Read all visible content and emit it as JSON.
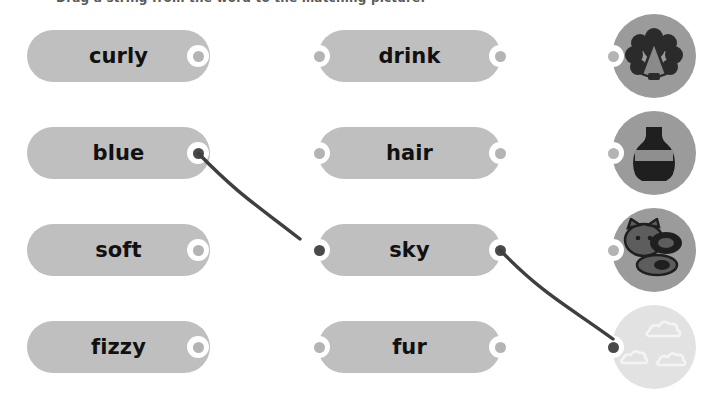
{
  "instruction": "Drag a string from the word to the matching picture.",
  "colors": {
    "pill": "#bfbfbf",
    "pill_text": "#111111",
    "knob_ring": "#ffffff",
    "knob_dot": "#b4b4b4",
    "knob_dot_active": "#4a4a4a",
    "picture_circle": "#9b9b9b",
    "picture_circle_faded": "#e2e2e2",
    "wire": "#3f3f3f",
    "background": "#ffffff"
  },
  "columns": {
    "left": {
      "name": "adjectives",
      "items": [
        {
          "label": "curly",
          "x": 27,
          "y": 30,
          "w": 183,
          "h": 52,
          "knob_x": 187,
          "knob_y": 45,
          "connected": false
        },
        {
          "label": "blue",
          "x": 27,
          "y": 127,
          "w": 183,
          "h": 52,
          "knob_x": 187,
          "knob_y": 142,
          "connected": true
        },
        {
          "label": "soft",
          "x": 27,
          "y": 224,
          "w": 183,
          "h": 52,
          "knob_x": 187,
          "knob_y": 239,
          "connected": false
        },
        {
          "label": "fizzy",
          "x": 27,
          "y": 321,
          "w": 183,
          "h": 52,
          "knob_x": 187,
          "knob_y": 336,
          "connected": false
        }
      ]
    },
    "middle": {
      "name": "nouns",
      "items": [
        {
          "label": "drink",
          "x": 318,
          "y": 30,
          "w": 183,
          "h": 52,
          "knob_left_x": 308,
          "knob_right_x": 489,
          "knob_y": 45,
          "connected_left": false,
          "connected_right": false
        },
        {
          "label": "hair",
          "x": 318,
          "y": 127,
          "w": 183,
          "h": 52,
          "knob_left_x": 308,
          "knob_right_x": 489,
          "knob_y": 142,
          "connected_left": false,
          "connected_right": false
        },
        {
          "label": "sky",
          "x": 318,
          "y": 224,
          "w": 183,
          "h": 52,
          "knob_left_x": 308,
          "knob_right_x": 489,
          "knob_y": 239,
          "connected_left": true,
          "connected_right": true
        },
        {
          "label": "fur",
          "x": 318,
          "y": 321,
          "w": 183,
          "h": 52,
          "knob_left_x": 308,
          "knob_right_x": 489,
          "knob_y": 336,
          "connected_left": false,
          "connected_right": false
        }
      ]
    },
    "right": {
      "name": "pictures",
      "items": [
        {
          "icon": "curly-hair-picture",
          "alt": "curly hair",
          "x": 612,
          "y": 14,
          "knob_x": 602,
          "knob_y": 45,
          "faded": false,
          "connected": false
        },
        {
          "icon": "bottle-picture",
          "alt": "bottle drink",
          "x": 612,
          "y": 111,
          "knob_x": 602,
          "knob_y": 142,
          "faded": false,
          "connected": false
        },
        {
          "icon": "animal-fur-picture",
          "alt": "furry animal",
          "x": 612,
          "y": 208,
          "knob_x": 602,
          "knob_y": 239,
          "faded": false,
          "connected": false
        },
        {
          "icon": "clouds-sky-picture",
          "alt": "clouds in sky",
          "x": 612,
          "y": 305,
          "knob_x": 602,
          "knob_y": 336,
          "faded": true,
          "connected": true
        }
      ]
    }
  },
  "connections": [
    {
      "from": "blue",
      "to": "sky",
      "path": "M 198 153 C 240 196 258 206 300 239"
    },
    {
      "from": "sky",
      "to": "clouds",
      "path": "M 500 250 C 545 296 568 306 613 339"
    }
  ]
}
